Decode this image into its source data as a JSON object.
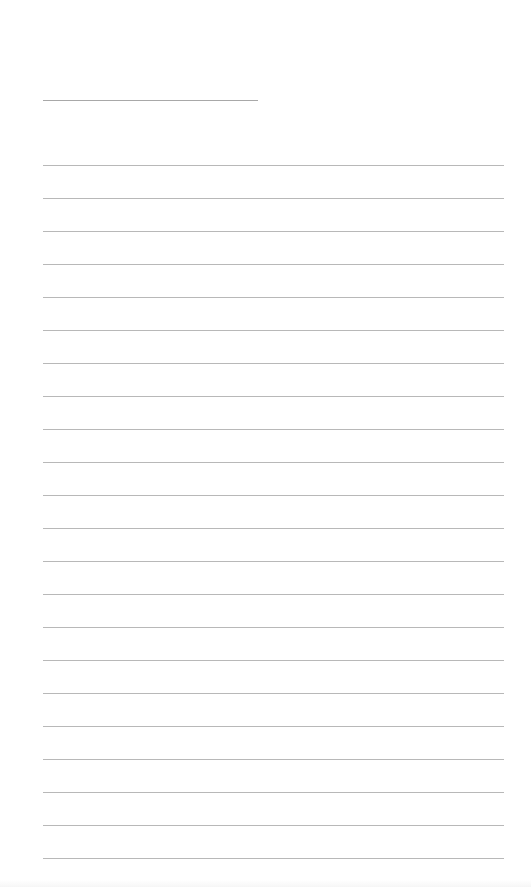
{
  "page": {
    "type": "lined-writing-sheet",
    "background_color": "#ffffff",
    "rule_color": "#b8b8b8"
  },
  "header_line": {
    "label": "",
    "value": ""
  },
  "lines": [
    {
      "value": ""
    },
    {
      "value": ""
    },
    {
      "value": ""
    },
    {
      "value": ""
    },
    {
      "value": ""
    },
    {
      "value": ""
    },
    {
      "value": ""
    },
    {
      "value": ""
    },
    {
      "value": ""
    },
    {
      "value": ""
    },
    {
      "value": ""
    },
    {
      "value": ""
    },
    {
      "value": ""
    },
    {
      "value": ""
    },
    {
      "value": ""
    },
    {
      "value": ""
    },
    {
      "value": ""
    },
    {
      "value": ""
    },
    {
      "value": ""
    },
    {
      "value": ""
    },
    {
      "value": ""
    },
    {
      "value": ""
    }
  ]
}
